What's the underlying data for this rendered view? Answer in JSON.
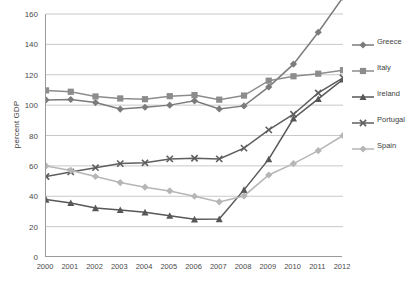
{
  "chart_data": {
    "type": "line",
    "title": "",
    "xlabel": "",
    "ylabel": "percent GDP",
    "categories": [
      "2000",
      "2001",
      "2002",
      "2003",
      "2004",
      "2005",
      "2006",
      "2007",
      "2008",
      "2009",
      "2010",
      "2011",
      "2012"
    ],
    "x": [
      2000,
      2001,
      2002,
      2003,
      2004,
      2005,
      2006,
      2007,
      2008,
      2009,
      2010,
      2011,
      2012
    ],
    "ylim": [
      0,
      160
    ],
    "xlim": [
      2000,
      2012
    ],
    "ytick_step": 20,
    "yticks": [
      0,
      20,
      40,
      60,
      80,
      100,
      120,
      140,
      160
    ],
    "grid": "horizontal",
    "legend_position": "right",
    "note_series_clipped": "Greece exceeds the 160 axis maximum in 2012",
    "series": [
      {
        "name": "Greece",
        "marker": "diamond",
        "color": "#7b7b7b",
        "values": [
          103.4,
          103.7,
          101.7,
          97.4,
          98.6,
          100.0,
          102.8,
          97.5,
          99.5,
          112.0,
          127.0,
          148.0,
          171.0
        ]
      },
      {
        "name": "Italy",
        "marker": "square",
        "color": "#8c8c8c",
        "values": [
          109.7,
          108.8,
          105.7,
          104.4,
          103.9,
          105.9,
          106.6,
          103.6,
          106.3,
          116.1,
          119.0,
          120.7,
          123.0
        ]
      },
      {
        "name": "Ireland",
        "marker": "triangle",
        "color": "#575757",
        "values": [
          37.8,
          35.6,
          32.2,
          31.0,
          29.4,
          27.2,
          24.8,
          25.0,
          44.2,
          64.4,
          91.2,
          104.1,
          117.0
        ]
      },
      {
        "name": "Portugal",
        "marker": "x",
        "color": "#5e5e5e",
        "values": [
          53.0,
          56.0,
          58.8,
          61.5,
          62.0,
          64.6,
          65.0,
          64.6,
          71.7,
          83.7,
          94.0,
          108.0,
          118.0
        ]
      },
      {
        "name": "Spain",
        "marker": "diamond-light",
        "color": "#b6b6b6",
        "values": [
          60.0,
          57.0,
          53.0,
          49.0,
          46.0,
          43.5,
          40.0,
          36.3,
          40.2,
          54.0,
          61.5,
          70.0,
          80.0
        ]
      }
    ]
  },
  "axis": {
    "y_title": "percent GDP",
    "y_labels": [
      "160",
      "140",
      "120",
      "100",
      "80",
      "60",
      "40",
      "20",
      "0"
    ],
    "x_labels": [
      "2000",
      "2001",
      "2002",
      "2003",
      "2004",
      "2005",
      "2006",
      "2007",
      "2008",
      "2009",
      "2010",
      "2011",
      "2012"
    ]
  },
  "legend": {
    "items": [
      {
        "label": "Greece"
      },
      {
        "label": "Italy"
      },
      {
        "label": "Ireland"
      },
      {
        "label": "Portugal"
      },
      {
        "label": "Spain"
      }
    ]
  }
}
